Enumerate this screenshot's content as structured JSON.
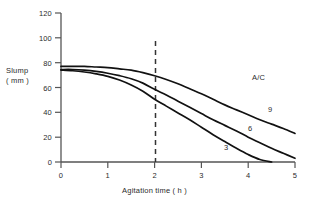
{
  "chart_data": {
    "type": "line",
    "title": "",
    "xlabel": "Agitation time ( h )",
    "ylabel_line1": "Slump",
    "ylabel_line2": "( mm )",
    "xlim": [
      0,
      5
    ],
    "ylim": [
      0,
      120
    ],
    "xticks": [
      "0",
      "1",
      "2",
      "3",
      "4",
      "5"
    ],
    "yticks": [
      "0",
      "20",
      "40",
      "60",
      "80",
      "100",
      "120"
    ],
    "grid": false,
    "legend_title": "A/C",
    "legend_position": "inline-right",
    "line_color": "#111111",
    "axis_color": "#555555",
    "annotations": [
      {
        "name": "reference-line",
        "type": "vertical-dashed",
        "x": 2
      }
    ],
    "series": [
      {
        "name": "9",
        "label": "9",
        "x": [
          0,
          0.25,
          0.5,
          0.75,
          1,
          1.25,
          1.5,
          1.75,
          2,
          2.25,
          2.5,
          2.75,
          3,
          3.25,
          3.5,
          3.75,
          4,
          4.25,
          4.5,
          4.75,
          5
        ],
        "values": [
          77,
          77,
          77,
          76.5,
          76,
          75,
          74,
          72,
          69.5,
          66.5,
          63,
          59,
          55,
          50.5,
          46,
          42,
          38,
          34,
          30.5,
          27,
          23
        ]
      },
      {
        "name": "6",
        "label": "6",
        "x": [
          0,
          0.25,
          0.5,
          0.75,
          1,
          1.25,
          1.5,
          1.75,
          2,
          2.25,
          2.5,
          2.75,
          3,
          3.25,
          3.5,
          3.75,
          4,
          4.25,
          4.5,
          4.75,
          5
        ],
        "values": [
          74.5,
          74.5,
          74,
          73,
          71.5,
          69.5,
          67,
          63.5,
          58.5,
          54,
          49,
          44,
          39,
          34,
          29.5,
          25,
          20,
          15.5,
          11,
          7,
          3
        ]
      },
      {
        "name": "3",
        "label": "3",
        "x": [
          0,
          0.25,
          0.5,
          0.75,
          1,
          1.25,
          1.5,
          1.75,
          2,
          2.25,
          2.5,
          2.75,
          3,
          3.25,
          3.5,
          3.75,
          4,
          4.25,
          4.5
        ],
        "values": [
          74,
          73.5,
          72.5,
          71,
          69,
          66,
          62,
          57,
          50.5,
          45,
          39.5,
          34,
          28,
          22,
          16.5,
          11,
          6,
          2,
          0
        ]
      }
    ]
  },
  "geometry": {
    "x0_px": 61,
    "x1_px": 295,
    "y0_px": 162,
    "y1_px": 13
  }
}
